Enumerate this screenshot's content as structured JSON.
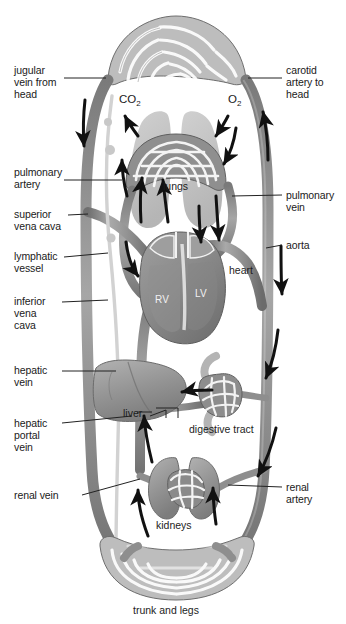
{
  "figure": {
    "type": "anatomical-diagram",
    "background_color": "#ffffff",
    "vessel_color": "#8e8e8e",
    "organ_color": "#9b9b9b",
    "arrow_color": "#111111",
    "leader_color": "#222222",
    "text_color": "#1a1a1a"
  },
  "labels_left": [
    {
      "id": "jugular-vein",
      "text": "jugular\nvein from\nhead"
    },
    {
      "id": "pulmonary-artery",
      "text": "pulmonary\nartery"
    },
    {
      "id": "superior-vena-cava",
      "text": "superior\nvena cava"
    },
    {
      "id": "lymphatic-vessel",
      "text": "lymphatic\nvessel"
    },
    {
      "id": "inferior-vena-cava",
      "text": "inferior\nvena\ncava"
    },
    {
      "id": "hepatic-vein",
      "text": "hepatic\nvein"
    },
    {
      "id": "hepatic-portal-vein",
      "text": "hepatic\nportal\nvein"
    },
    {
      "id": "renal-vein",
      "text": "renal vein"
    }
  ],
  "labels_right": [
    {
      "id": "carotid-artery",
      "text": "carotid\nartery to\nhead"
    },
    {
      "id": "pulmonary-vein",
      "text": "pulmonary\nvein"
    },
    {
      "id": "aorta",
      "text": "aorta"
    },
    {
      "id": "renal-artery",
      "text": "renal\nartery"
    }
  ],
  "labels_inner": [
    {
      "id": "lungs",
      "text": "lungs"
    },
    {
      "id": "heart",
      "text": "heart"
    },
    {
      "id": "liver",
      "text": "liver"
    },
    {
      "id": "digestive-tract",
      "text": "digestive tract"
    },
    {
      "id": "kidneys",
      "text": "kidneys"
    },
    {
      "id": "trunk-and-legs",
      "text": "trunk and legs"
    }
  ],
  "chamber_labels": [
    {
      "id": "right-ventricle",
      "text": "RV"
    },
    {
      "id": "left-ventricle",
      "text": "LV"
    }
  ],
  "gas_labels": [
    {
      "id": "carbon-dioxide",
      "symbol": "CO",
      "sub": "2"
    },
    {
      "id": "oxygen",
      "symbol": "O",
      "sub": "2"
    }
  ]
}
